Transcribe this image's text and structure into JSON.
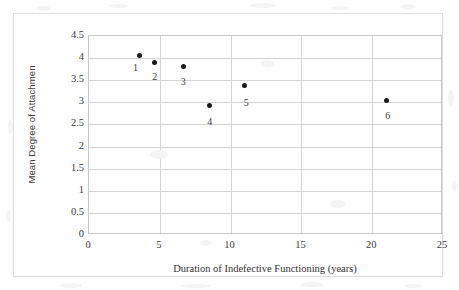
{
  "figure": {
    "name": "scatter-plot-attachment-vs-duration"
  },
  "axes": {
    "x_title": "Duration of Indefective Functioning (years)",
    "y_title": "Mean Degree of Attachmen",
    "x_ticks": [
      "0",
      "5",
      "10",
      "15",
      "20",
      "25"
    ],
    "y_ticks": [
      "0",
      "0.5",
      "1",
      "1.5",
      "2",
      "2.5",
      "3",
      "3.5",
      "4",
      "4.5"
    ]
  },
  "colors": {
    "point": "#1a1a1a",
    "gridline": "#d5d5d5",
    "plot_border": "#c9c9c9",
    "frame_border": "#dedede",
    "text": "#3d3d3d",
    "background": "#ffffff"
  },
  "chart_data": {
    "type": "scatter",
    "title": "",
    "xlabel": "Duration of Indefective Functioning (years)",
    "ylabel": "Mean Degree of Attachmen",
    "xlim": [
      0,
      25
    ],
    "ylim": [
      0,
      4.5
    ],
    "xticks": [
      0,
      5,
      10,
      15,
      20,
      25
    ],
    "yticks": [
      0,
      0.5,
      1,
      1.5,
      2,
      2.5,
      3,
      3.5,
      4,
      4.5
    ],
    "grid": true,
    "legend": false,
    "points": [
      {
        "label": "1",
        "x": 3.6,
        "y": 4.05,
        "label_dx": -7,
        "label_dy": 7
      },
      {
        "label": "2",
        "x": 4.6,
        "y": 3.9,
        "label_dx": -2,
        "label_dy": 9
      },
      {
        "label": "3",
        "x": 6.7,
        "y": 3.8,
        "label_dx": -3,
        "label_dy": 10
      },
      {
        "label": "4",
        "x": 8.5,
        "y": 2.93,
        "label_dx": -2,
        "label_dy": 12
      },
      {
        "label": "5",
        "x": 11.0,
        "y": 3.37,
        "label_dx": -1,
        "label_dy": 12
      },
      {
        "label": "6",
        "x": 21.0,
        "y": 3.05,
        "label_dx": -1,
        "label_dy": 11
      }
    ]
  }
}
